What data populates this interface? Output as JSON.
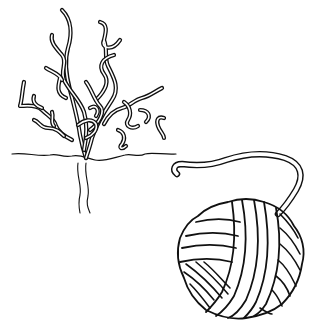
{
  "illustration": {
    "style": "black-and-white line art",
    "background_color": "#ffffff",
    "line_color": "#111111",
    "objects": [
      {
        "name": "tree-with-roots",
        "description": "bare tangled tree with curly branches above a ground line and roots below",
        "position": "upper-left"
      },
      {
        "name": "ball-of-yarn",
        "description": "wound yarn ball with a loose strand extending to the upper left",
        "position": "lower-right"
      }
    ]
  }
}
